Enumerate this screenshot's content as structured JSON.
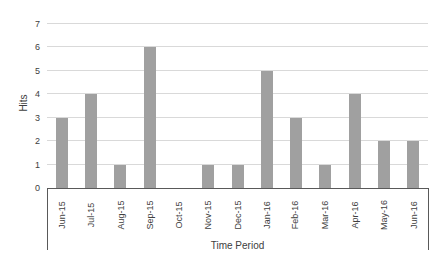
{
  "chart_data": {
    "type": "bar",
    "categories": [
      "Jun-15",
      "Jul-15",
      "Aug-15",
      "Sep-15",
      "Oct-15",
      "Nov-15",
      "Dec-15",
      "Jan-16",
      "Feb-16",
      "Mar-16",
      "Apr-16",
      "May-16",
      "Jun-16"
    ],
    "values": [
      3,
      4,
      1,
      6,
      0,
      1,
      1,
      5,
      3,
      1,
      4,
      2,
      2
    ],
    "xlabel": "Time Period",
    "ylabel": "Hits",
    "ylim": [
      0,
      7
    ],
    "ytick_interval": 1,
    "grid": true,
    "legend": false,
    "colors": {
      "bar": "#a0a0a0",
      "gridline": "#d9d9d9",
      "axis": "#595959",
      "text": "#404040",
      "background": "#ffffff"
    }
  }
}
